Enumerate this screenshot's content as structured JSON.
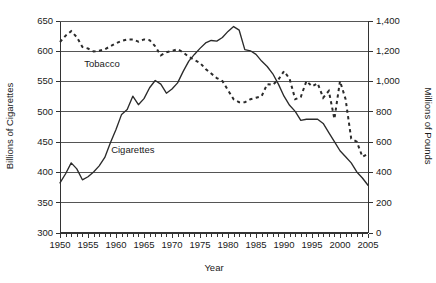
{
  "chart_data": {
    "type": "line",
    "title": "",
    "xlabel": "Year",
    "ylabel": "Billions of Cigarettes",
    "y2label": "Millions of Pounds",
    "xlim": [
      1950,
      2005
    ],
    "ylim": [
      300,
      650
    ],
    "y2lim": [
      0,
      1400
    ],
    "grid": true,
    "legend": "inline-annotations",
    "x_ticks_major": [
      1950,
      1955,
      1960,
      1965,
      1970,
      1975,
      1980,
      1985,
      1990,
      1995,
      2000,
      2005
    ],
    "x_tick_labels": [
      "1950",
      "1955",
      "1960",
      "1965",
      "1970",
      "1975",
      "1980",
      "1985",
      "1990",
      "1995",
      "2000",
      "2005"
    ],
    "x_minor_tick_step": 1,
    "y_ticks": [
      300,
      350,
      400,
      450,
      500,
      550,
      600,
      650
    ],
    "y_tick_labels": [
      "300",
      "350",
      "400",
      "450",
      "500",
      "550",
      "600",
      "650"
    ],
    "y2_ticks": [
      0,
      200,
      400,
      600,
      800,
      1000,
      1200,
      1400
    ],
    "y2_tick_labels": [
      "0",
      "200",
      "400",
      "600",
      "800",
      "1,000",
      "1,200",
      "1,400"
    ],
    "annotations": [
      {
        "text": "Tobacco",
        "x": 1957.5,
        "y": 573
      },
      {
        "text": "Cigarettes",
        "x": 1963.0,
        "y": 432
      }
    ],
    "series": [
      {
        "name": "Cigarettes",
        "axis": "left",
        "style": "solid",
        "color": "#2b2b2b",
        "units": "Billions of Cigarettes",
        "x": [
          1950,
          1951,
          1952,
          1953,
          1954,
          1955,
          1956,
          1957,
          1958,
          1959,
          1960,
          1961,
          1962,
          1963,
          1964,
          1965,
          1966,
          1967,
          1968,
          1969,
          1970,
          1971,
          1972,
          1973,
          1974,
          1975,
          1976,
          1977,
          1978,
          1979,
          1980,
          1981,
          1982,
          1983,
          1984,
          1985,
          1986,
          1987,
          1988,
          1989,
          1990,
          1991,
          1992,
          1993,
          1994,
          1995,
          1996,
          1997,
          1998,
          1999,
          2000,
          2001,
          2002,
          2003,
          2004,
          2005
        ],
        "values": [
          382,
          397,
          415,
          405,
          387,
          392,
          400,
          410,
          424,
          448,
          470,
          495,
          503,
          525,
          511,
          521,
          539,
          551,
          545,
          530,
          537,
          547,
          566,
          583,
          594,
          604,
          613,
          617,
          616,
          622,
          632,
          640,
          634,
          602,
          600,
          594,
          583,
          574,
          562,
          545,
          525,
          510,
          500,
          485,
          487,
          487,
          487,
          480,
          465,
          450,
          435,
          425,
          415,
          400,
          390,
          378
        ]
      },
      {
        "name": "Tobacco",
        "axis": "right",
        "style": "dashed",
        "color": "#2b2b2b",
        "units": "Millions of Pounds",
        "x": [
          1950,
          1951,
          1952,
          1953,
          1954,
          1955,
          1956,
          1957,
          1958,
          1959,
          1960,
          1961,
          1962,
          1963,
          1964,
          1965,
          1966,
          1967,
          1968,
          1969,
          1970,
          1971,
          1972,
          1973,
          1974,
          1975,
          1976,
          1977,
          1978,
          1979,
          1980,
          1981,
          1982,
          1983,
          1984,
          1985,
          1986,
          1987,
          1988,
          1989,
          1990,
          1991,
          1992,
          1993,
          1994,
          1995,
          1996,
          1997,
          1998,
          1999,
          2000,
          2001,
          2002,
          2003,
          2004,
          2005
        ],
        "values": [
          1258,
          1300,
          1330,
          1290,
          1225,
          1215,
          1195,
          1200,
          1210,
          1230,
          1250,
          1265,
          1275,
          1275,
          1260,
          1275,
          1270,
          1230,
          1170,
          1190,
          1200,
          1210,
          1190,
          1160,
          1140,
          1120,
          1080,
          1050,
          1020,
          1000,
          940,
          880,
          860,
          860,
          880,
          890,
          900,
          980,
          975,
          1010,
          1065,
          1015,
          880,
          895,
          1000,
          965,
          985,
          890,
          935,
          750,
          1000,
          880,
          620,
          600,
          500,
          520
        ]
      }
    ]
  },
  "axes": {
    "x_title": "Year",
    "y_left_title": "Billions of Cigarettes",
    "y_right_title": "Millions of Pounds"
  },
  "labels": {
    "tobacco": "Tobacco",
    "cigarettes": "Cigarettes"
  }
}
